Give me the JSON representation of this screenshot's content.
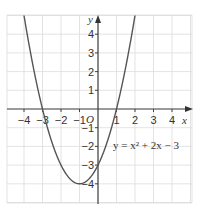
{
  "chart_data": {
    "type": "line",
    "title": "",
    "equation_label": "y = x² + 2x − 3",
    "xlabel": "x",
    "ylabel": "y",
    "origin_label": "O",
    "xlim": [
      -4.8,
      5.1
    ],
    "ylim": [
      -5,
      5
    ],
    "x_ticks": [
      -4,
      -3,
      -2,
      -1,
      1,
      2,
      3,
      4
    ],
    "y_ticks": [
      4,
      3,
      2,
      1,
      -1,
      -2,
      -3,
      -4
    ],
    "x_tick_labels": [
      "−4",
      "−3",
      "−2",
      "−1",
      "1",
      "2",
      "3",
      "4"
    ],
    "y_tick_labels": [
      "4",
      "3",
      "2",
      "1",
      "−1",
      "−2",
      "−3",
      "−4"
    ],
    "grid": true,
    "series": [
      {
        "name": "y = x^2 + 2x - 3",
        "x": [
          -4,
          -3,
          -2,
          -1,
          0,
          1,
          2
        ],
        "y": [
          5,
          0,
          -3,
          -4,
          -3,
          0,
          5
        ]
      }
    ],
    "key_points": {
      "roots": [
        -3,
        1
      ],
      "y_intercept": -3,
      "vertex": [
        -1,
        -4
      ]
    }
  },
  "colors": {
    "grid": "#dcdcdc",
    "axis": "#444444",
    "curve": "#555555"
  }
}
